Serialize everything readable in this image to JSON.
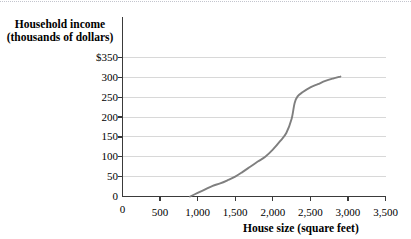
{
  "chart_data": {
    "type": "line",
    "title": "",
    "xlabel": "House size (square feet)",
    "ylabel": "Household income (thousands of dollars)",
    "ylabel_line1": "Household income",
    "ylabel_line2": "(thousands of dollars)",
    "xlim": [
      0,
      3500
    ],
    "ylim": [
      0,
      350
    ],
    "grid": true,
    "legend": "none",
    "x_ticks": [
      0,
      500,
      1000,
      1500,
      2000,
      2500,
      3000,
      3500
    ],
    "x_tick_labels": [
      "0",
      "500",
      "1,000",
      "1,500",
      "2,000",
      "2,500",
      "3,000",
      "3,500"
    ],
    "y_ticks": [
      0,
      50,
      100,
      150,
      200,
      250,
      300,
      350
    ],
    "y_tick_labels": [
      "0",
      "50",
      "100",
      "150",
      "200",
      "250",
      "300",
      "$350"
    ],
    "series": [
      {
        "name": "income vs house size",
        "color": "#7f7f7f",
        "x": [
          900,
          1000,
          1100,
          1200,
          1300,
          1400,
          1500,
          1600,
          1700,
          1800,
          1900,
          2000,
          2100,
          2180,
          2250,
          2290,
          2330,
          2400,
          2500,
          2600,
          2700,
          2800,
          2900
        ],
        "y": [
          0,
          9,
          18,
          27,
          33,
          41,
          50,
          62,
          75,
          88,
          100,
          118,
          140,
          160,
          195,
          235,
          252,
          263,
          275,
          283,
          291,
          297,
          302
        ]
      }
    ]
  },
  "colors": {
    "curve": "#7f7f7f",
    "gridline": "#d8d8d8",
    "axis": "#3a3a3a",
    "text": "#000000",
    "background": "#ffffff",
    "top_border": "#b9bcc6"
  }
}
